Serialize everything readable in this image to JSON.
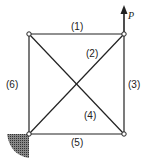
{
  "diagram": {
    "type": "truss",
    "load_label": "P",
    "members": [
      {
        "id": "1",
        "label": "(1)",
        "from": "top-left",
        "to": "top-right"
      },
      {
        "id": "2",
        "label": "(2)",
        "from": "bottom-left",
        "to": "top-right"
      },
      {
        "id": "3",
        "label": "(3)",
        "from": "top-right",
        "to": "bottom-right"
      },
      {
        "id": "4",
        "label": "(4)",
        "from": "top-left",
        "to": "bottom-right"
      },
      {
        "id": "5",
        "label": "(5)",
        "from": "bottom-left",
        "to": "bottom-right"
      },
      {
        "id": "6",
        "label": "(6)",
        "from": "top-left",
        "to": "bottom-left"
      }
    ],
    "support": "fixed-wall-bottom-left",
    "colors": {
      "line": "#222222",
      "hatch": "#555555"
    }
  }
}
